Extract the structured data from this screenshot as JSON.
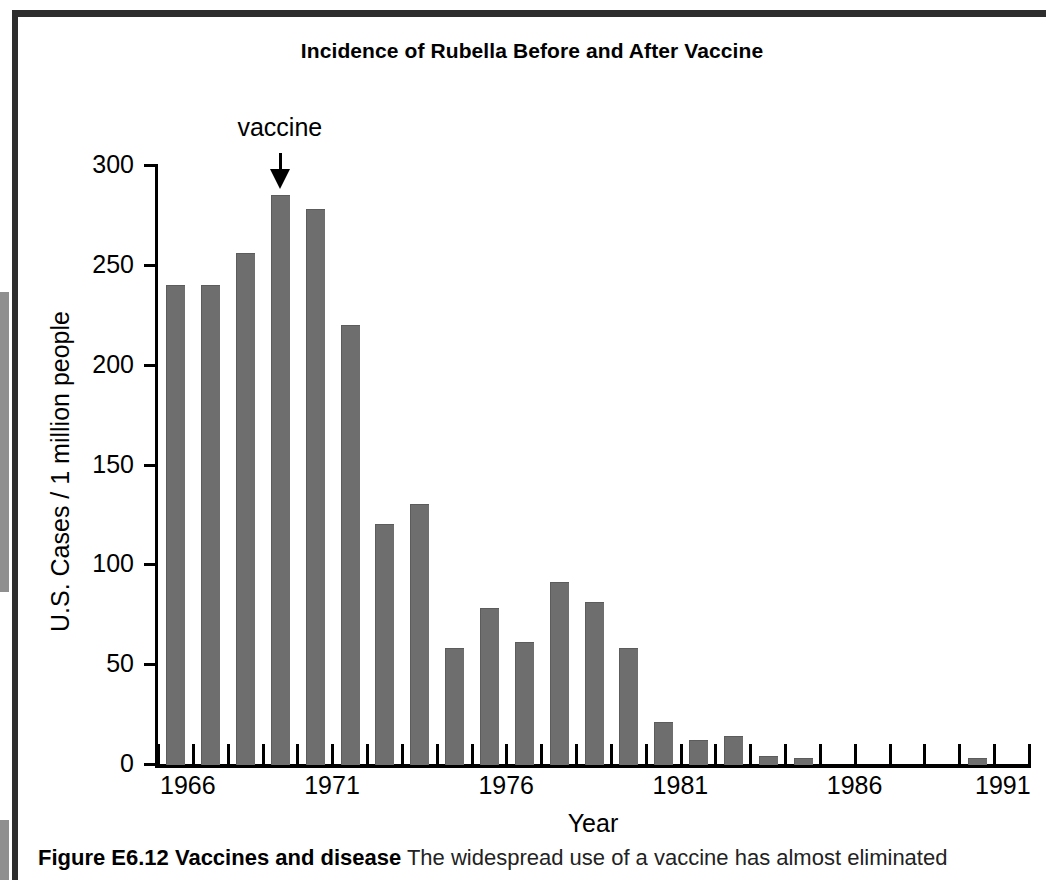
{
  "figure": {
    "title": "Incidence of Rubella Before and After Vaccine",
    "caption_bold": "Figure E6.12  Vaccines and disease",
    "caption_rest": "  The widespread use of a vaccine has almost eliminated"
  },
  "annotation": {
    "label": "vaccine",
    "points_to_year": 1969
  },
  "colors": {
    "bar": "#6e6e6e",
    "axis": "#000000",
    "background": "#ffffff",
    "rule": "#2e2e2e"
  },
  "chart_data": {
    "type": "bar",
    "title": "Incidence of Rubella Before and After Vaccine",
    "xlabel": "Year",
    "ylabel": "U.S. Cases / 1 million people",
    "ylim": [
      0,
      300
    ],
    "yticks": [
      0,
      50,
      100,
      150,
      200,
      250,
      300
    ],
    "ytick_labels": [
      "0",
      "50",
      "100",
      "150",
      "200",
      "250",
      "300"
    ],
    "xlim": [
      1966,
      1991
    ],
    "xtick_labels": [
      "1966",
      "1971",
      "1976",
      "1981",
      "1986",
      "1991"
    ],
    "xtick_years": [
      1966,
      1971,
      1976,
      1981,
      1986,
      1991
    ],
    "grid": false,
    "legend": null,
    "categories": [
      1966,
      1967,
      1968,
      1969,
      1970,
      1971,
      1972,
      1973,
      1974,
      1975,
      1976,
      1977,
      1978,
      1979,
      1980,
      1981,
      1982,
      1983,
      1984,
      1985,
      1986,
      1987,
      1988,
      1989,
      1990
    ],
    "values": [
      240,
      240,
      256,
      285,
      278,
      220,
      120,
      130,
      58,
      78,
      61,
      91,
      81,
      58,
      21,
      12,
      14,
      4,
      3,
      0,
      0,
      0,
      0,
      3,
      0
    ],
    "annotations": [
      {
        "text": "vaccine",
        "year": 1969,
        "type": "arrow-down"
      }
    ]
  }
}
